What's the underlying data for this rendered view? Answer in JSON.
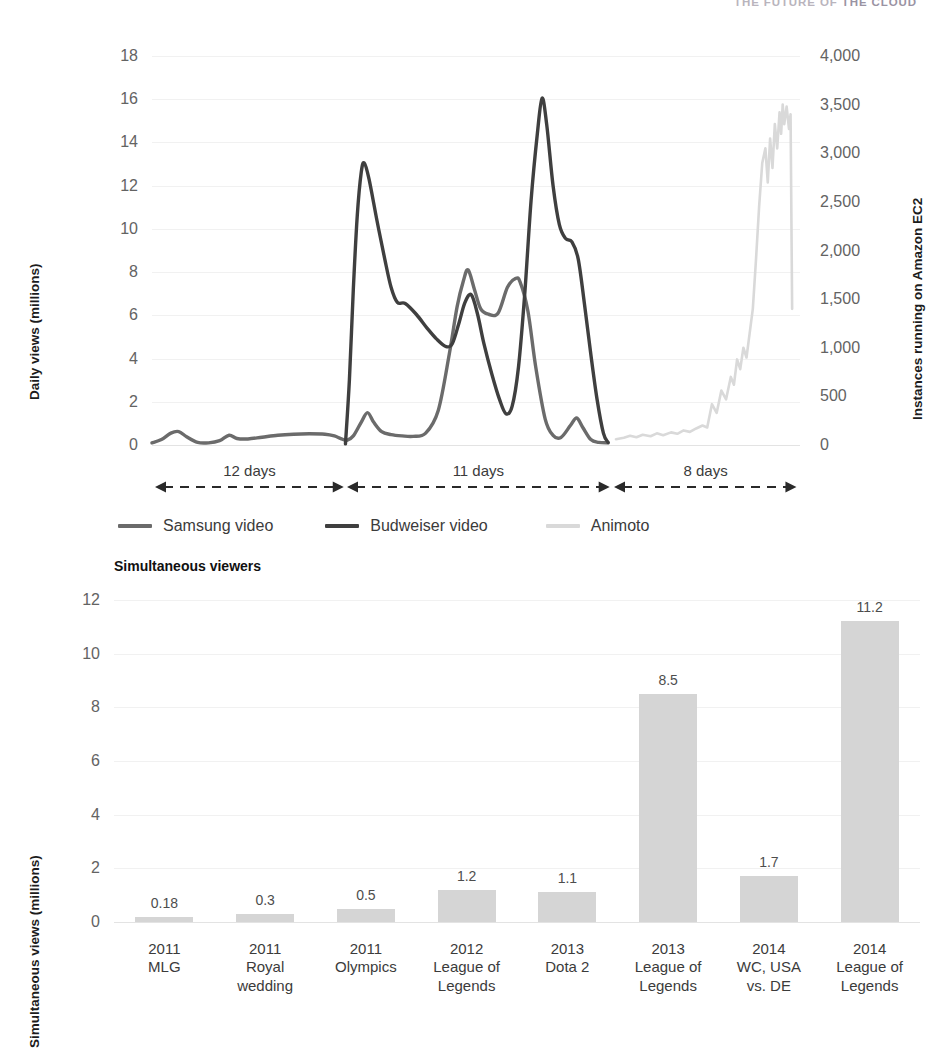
{
  "running_header": {
    "prefix": "THE FUTURE OF ",
    "accent": "THE CLOUD"
  },
  "chart_data": [
    {
      "id": "viral-video-vs-ec2",
      "type": "line",
      "title": "",
      "xlabel": "",
      "ylabel": "Daily views (millions)",
      "y2label": "Instances running on Amazon EC2",
      "ylim": [
        0,
        18
      ],
      "y2lim": [
        0,
        4000
      ],
      "yticks": [
        "0",
        "2",
        "4",
        "6",
        "8",
        "10",
        "12",
        "14",
        "16",
        "18"
      ],
      "y2ticks": [
        "0",
        "500",
        "1,000",
        "1,500",
        "2,000",
        "2,500",
        "3,000",
        "3,500",
        "4,000"
      ],
      "grid": true,
      "legend_position": "bottom-left",
      "span_annotations": [
        {
          "label": "12 days"
        },
        {
          "label": "11 days"
        },
        {
          "label": "8 days"
        }
      ],
      "series": [
        {
          "name": "Samsung video",
          "color": "#6b6b6b",
          "axis": "left",
          "points": [
            [
              0.0,
              0.1
            ],
            [
              0.6,
              0.25
            ],
            [
              1.2,
              0.55
            ],
            [
              1.7,
              0.62
            ],
            [
              2.2,
              0.38
            ],
            [
              2.9,
              0.12
            ],
            [
              3.6,
              0.1
            ],
            [
              4.3,
              0.2
            ],
            [
              4.9,
              0.45
            ],
            [
              5.4,
              0.3
            ],
            [
              6.1,
              0.28
            ],
            [
              7.0,
              0.36
            ],
            [
              8.0,
              0.45
            ],
            [
              9.0,
              0.5
            ],
            [
              10.0,
              0.52
            ],
            [
              11.0,
              0.5
            ],
            [
              11.6,
              0.42
            ],
            [
              12.0,
              0.3
            ],
            [
              12.4,
              0.22
            ],
            [
              12.8,
              0.42
            ],
            [
              13.3,
              1.05
            ],
            [
              13.7,
              1.5
            ],
            [
              14.1,
              1.05
            ],
            [
              14.6,
              0.62
            ],
            [
              15.2,
              0.48
            ],
            [
              15.9,
              0.42
            ],
            [
              16.6,
              0.4
            ],
            [
              17.4,
              0.55
            ],
            [
              18.2,
              1.6
            ],
            [
              18.9,
              4.2
            ],
            [
              19.4,
              6.4
            ],
            [
              19.8,
              7.6
            ],
            [
              20.1,
              8.1
            ],
            [
              20.5,
              7.2
            ],
            [
              20.9,
              6.3
            ],
            [
              21.4,
              6.05
            ],
            [
              22.0,
              6.1
            ],
            [
              22.6,
              7.3
            ],
            [
              23.1,
              7.7
            ],
            [
              23.4,
              7.55
            ],
            [
              23.9,
              6.2
            ],
            [
              24.4,
              3.6
            ],
            [
              25.0,
              1.2
            ],
            [
              25.5,
              0.45
            ],
            [
              26.0,
              0.35
            ],
            [
              26.6,
              0.9
            ],
            [
              27.0,
              1.25
            ],
            [
              27.4,
              0.8
            ],
            [
              27.9,
              0.25
            ],
            [
              28.4,
              0.12
            ],
            [
              29.0,
              0.1
            ]
          ]
        },
        {
          "name": "Budweiser video",
          "color": "#3f3f3f",
          "axis": "left",
          "points": [
            [
              12.3,
              0.05
            ],
            [
              12.55,
              3.0
            ],
            [
              12.8,
              7.2
            ],
            [
              13.05,
              10.6
            ],
            [
              13.3,
              12.6
            ],
            [
              13.5,
              13.05
            ],
            [
              13.8,
              12.3
            ],
            [
              14.3,
              10.4
            ],
            [
              14.8,
              8.6
            ],
            [
              15.2,
              7.3
            ],
            [
              15.6,
              6.6
            ],
            [
              16.1,
              6.55
            ],
            [
              16.8,
              6.05
            ],
            [
              17.5,
              5.4
            ],
            [
              18.1,
              4.9
            ],
            [
              18.7,
              4.55
            ],
            [
              19.1,
              4.7
            ],
            [
              19.5,
              5.6
            ],
            [
              19.9,
              6.6
            ],
            [
              20.3,
              6.95
            ],
            [
              20.7,
              6.05
            ],
            [
              21.1,
              4.7
            ],
            [
              21.6,
              3.3
            ],
            [
              22.1,
              2.1
            ],
            [
              22.5,
              1.45
            ],
            [
              22.9,
              1.8
            ],
            [
              23.3,
              3.6
            ],
            [
              23.7,
              7.0
            ],
            [
              24.1,
              11.3
            ],
            [
              24.5,
              14.4
            ],
            [
              24.8,
              16.05
            ],
            [
              25.1,
              14.8
            ],
            [
              25.5,
              12.0
            ],
            [
              25.9,
              10.2
            ],
            [
              26.3,
              9.55
            ],
            [
              26.7,
              9.4
            ],
            [
              27.1,
              8.6
            ],
            [
              27.5,
              6.5
            ],
            [
              27.9,
              4.2
            ],
            [
              28.3,
              2.1
            ],
            [
              28.7,
              0.55
            ],
            [
              29.0,
              0.12
            ]
          ]
        },
        {
          "name": "Animoto",
          "color": "#d9d9d9",
          "axis": "right",
          "note": "noisy instance-count trace rising to ~3,500 then dropping to ~1,400",
          "points": [
            [
              29.5,
              60
            ],
            [
              30.0,
              75
            ],
            [
              30.4,
              95
            ],
            [
              30.8,
              80
            ],
            [
              31.2,
              105
            ],
            [
              31.7,
              90
            ],
            [
              32.1,
              120
            ],
            [
              32.5,
              100
            ],
            [
              33.0,
              130
            ],
            [
              33.4,
              115
            ],
            [
              33.8,
              150
            ],
            [
              34.2,
              135
            ],
            [
              34.6,
              170
            ],
            [
              35.0,
              200
            ],
            [
              35.3,
              180
            ],
            [
              35.6,
              420
            ],
            [
              35.9,
              330
            ],
            [
              36.2,
              560
            ],
            [
              36.5,
              470
            ],
            [
              36.8,
              700
            ],
            [
              37.0,
              620
            ],
            [
              37.2,
              880
            ],
            [
              37.4,
              780
            ],
            [
              37.6,
              1000
            ],
            [
              37.8,
              900
            ],
            [
              38.0,
              1150
            ],
            [
              38.2,
              1400
            ],
            [
              38.4,
              1900
            ],
            [
              38.6,
              2450
            ],
            [
              38.8,
              2900
            ],
            [
              39.0,
              3050
            ],
            [
              39.15,
              2700
            ],
            [
              39.3,
              3150
            ],
            [
              39.45,
              2850
            ],
            [
              39.6,
              3300
            ],
            [
              39.75,
              3050
            ],
            [
              39.9,
              3420
            ],
            [
              40.0,
              3200
            ],
            [
              40.1,
              3500
            ],
            [
              40.2,
              3300
            ],
            [
              40.35,
              3480
            ],
            [
              40.5,
              3250
            ],
            [
              40.6,
              3400
            ],
            [
              40.7,
              1400
            ]
          ]
        }
      ]
    },
    {
      "id": "simultaneous-viewers",
      "type": "bar",
      "title": "Simultaneous viewers",
      "xlabel": "",
      "ylabel": "Simultaneous views (millions)",
      "ylim": [
        0,
        12
      ],
      "yticks": [
        "0",
        "2",
        "4",
        "6",
        "8",
        "10",
        "12"
      ],
      "grid": true,
      "bar_color": "#d5d5d5",
      "categories": [
        [
          "2011",
          "MLG"
        ],
        [
          "2011",
          "Royal",
          "wedding"
        ],
        [
          "2011",
          "Olympics"
        ],
        [
          "2012",
          "League of",
          "Legends"
        ],
        [
          "2013",
          "Dota 2"
        ],
        [
          "2013",
          "League of",
          "Legends"
        ],
        [
          "2014",
          "WC, USA",
          "vs. DE"
        ],
        [
          "2014",
          "League of",
          "Legends"
        ]
      ],
      "values": [
        0.18,
        0.3,
        0.5,
        1.2,
        1.1,
        8.5,
        1.7,
        11.2
      ],
      "value_labels": [
        "0.18",
        "0.3",
        "0.5",
        "1.2",
        "1.1",
        "8.5",
        "1.7",
        "11.2"
      ]
    }
  ]
}
